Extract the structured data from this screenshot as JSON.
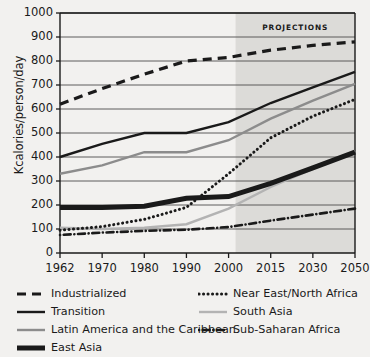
{
  "chart_data": {
    "type": "line",
    "title": "",
    "xlabel": "",
    "ylabel": "Kcalories/person/day",
    "categories": [
      "1962",
      "1970",
      "1980",
      "1990",
      "2000",
      "2015",
      "2030",
      "2050"
    ],
    "ylim": [
      0,
      1000
    ],
    "yticks": [
      "0",
      "100",
      "200",
      "300",
      "400",
      "500",
      "600",
      "700",
      "800",
      "900",
      "1000"
    ],
    "grid": true,
    "legend_position": "bottom",
    "annotations": [
      {
        "text": "PROJECTIONS",
        "start_category": "2000",
        "end_category": "2050",
        "note": "shaded band covering projected years"
      }
    ],
    "series": [
      {
        "name": "Industrialized",
        "style": "dashed",
        "color": "#1a1a1a",
        "values": [
          620,
          685,
          745,
          800,
          815,
          845,
          865,
          880
        ]
      },
      {
        "name": "Transition",
        "style": "solid",
        "color": "#1a1a1a",
        "values": [
          400,
          455,
          500,
          500,
          545,
          625,
          690,
          755
        ]
      },
      {
        "name": "Latin America and the Caribbean",
        "style": "solid",
        "color": "#8c8c8c",
        "values": [
          330,
          365,
          420,
          420,
          470,
          560,
          635,
          705
        ]
      },
      {
        "name": "East Asia",
        "style": "thick-solid",
        "color": "#1a1a1a",
        "values": [
          190,
          190,
          195,
          228,
          235,
          290,
          355,
          420
        ]
      },
      {
        "name": "Near East/North Africa",
        "style": "dotted",
        "color": "#1a1a1a",
        "values": [
          95,
          110,
          140,
          190,
          330,
          480,
          570,
          640
        ]
      },
      {
        "name": "South Asia",
        "style": "solid-light",
        "color": "#b3b3b3",
        "values": [
          105,
          100,
          105,
          120,
          185,
          275,
          350,
          425
        ]
      },
      {
        "name": "Sub-Saharan Africa",
        "style": "dash-dot",
        "color": "#1a1a1a",
        "values": [
          75,
          85,
          92,
          97,
          108,
          135,
          160,
          185
        ]
      }
    ]
  },
  "legend": {
    "items": [
      {
        "label": "Industrialized",
        "style": "dashed",
        "color": "#1a1a1a"
      },
      {
        "label": "Transition",
        "style": "solid",
        "color": "#1a1a1a"
      },
      {
        "label": "Latin America and the Caribbean",
        "style": "solid",
        "color": "#8c8c8c"
      },
      {
        "label": "East Asia",
        "style": "thick-solid",
        "color": "#1a1a1a"
      },
      {
        "label": "Near East/North Africa",
        "style": "dotted",
        "color": "#1a1a1a"
      },
      {
        "label": "South Asia",
        "style": "solid-light",
        "color": "#b3b3b3"
      },
      {
        "label": "Sub-Saharan Africa",
        "style": "dash-dot",
        "color": "#1a1a1a"
      }
    ]
  },
  "colors": {
    "background": "#f2f1ef",
    "axis": "#1a1a1a",
    "grid": "#4d4d4d",
    "projection_band": "#dcdbd8"
  }
}
